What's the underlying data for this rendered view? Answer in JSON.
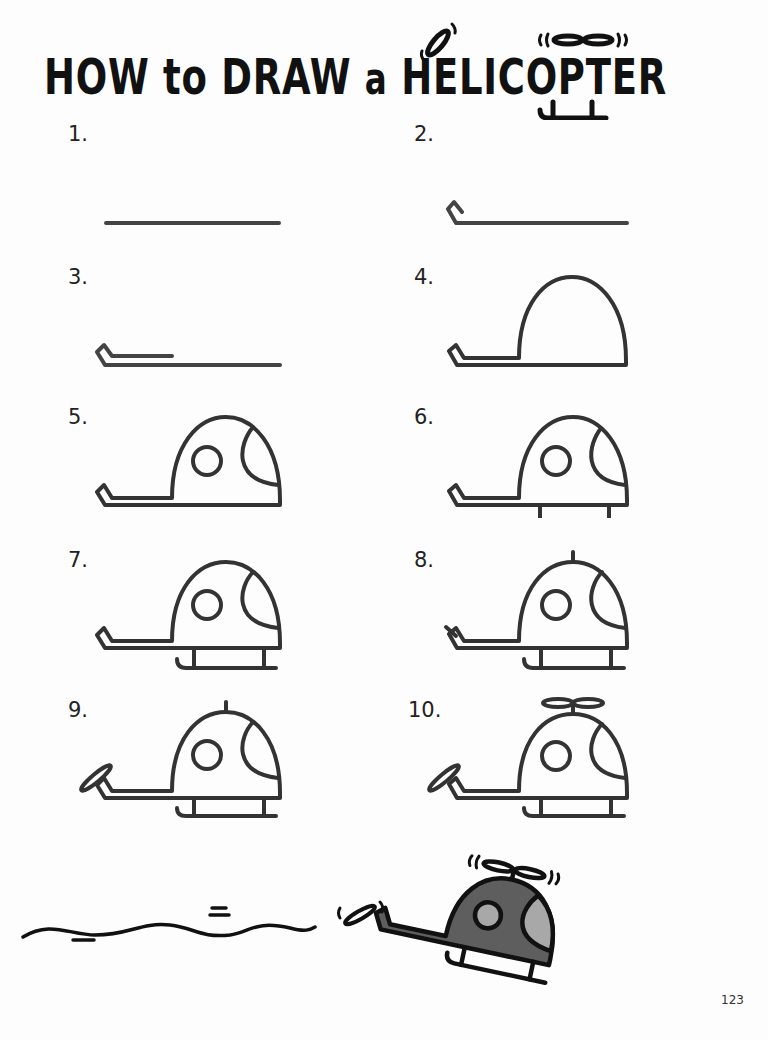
{
  "page": {
    "title": {
      "part1": "HOW to DRAW",
      "part2": "a",
      "part3": "HELICOPTER"
    },
    "steps": [
      {
        "number": "1.",
        "description": "long horizontal line"
      },
      {
        "number": "2.",
        "description": "small tail hook on left of line"
      },
      {
        "number": "3.",
        "description": "short upper tail boom line"
      },
      {
        "number": "4.",
        "description": "dome cabin shape"
      },
      {
        "number": "5.",
        "description": "round window and windshield"
      },
      {
        "number": "6.",
        "description": "two skid struts"
      },
      {
        "number": "7.",
        "description": "landing skid"
      },
      {
        "number": "8.",
        "description": "rotor mast and tail rotor mount"
      },
      {
        "number": "9.",
        "description": "tail rotor"
      },
      {
        "number": "10.",
        "description": "main rotor"
      }
    ],
    "final_illustration": {
      "description": "colored helicopter flying with motion line",
      "colors": {
        "body": "#5e5e5e",
        "window": "#a8a8a8",
        "outline": "#111111"
      }
    },
    "page_number": "123"
  }
}
